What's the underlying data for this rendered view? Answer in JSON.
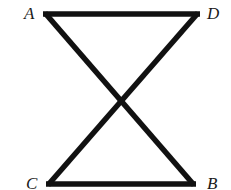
{
  "diagram": {
    "type": "geometry",
    "points": {
      "A": {
        "label": "A",
        "x": 43,
        "y": 14
      },
      "D": {
        "label": "D",
        "x": 200,
        "y": 14
      },
      "C": {
        "label": "C",
        "x": 46,
        "y": 184
      },
      "B": {
        "label": "B",
        "x": 196,
        "y": 184
      }
    },
    "segments": [
      {
        "from": "A",
        "to": "D"
      },
      {
        "from": "C",
        "to": "B"
      },
      {
        "from": "A",
        "to": "B"
      },
      {
        "from": "D",
        "to": "C"
      }
    ],
    "labels": {
      "A": "A",
      "B": "B",
      "C": "C",
      "D": "D"
    },
    "colors": {
      "stroke": "#111111",
      "background": "#ffffff"
    }
  }
}
